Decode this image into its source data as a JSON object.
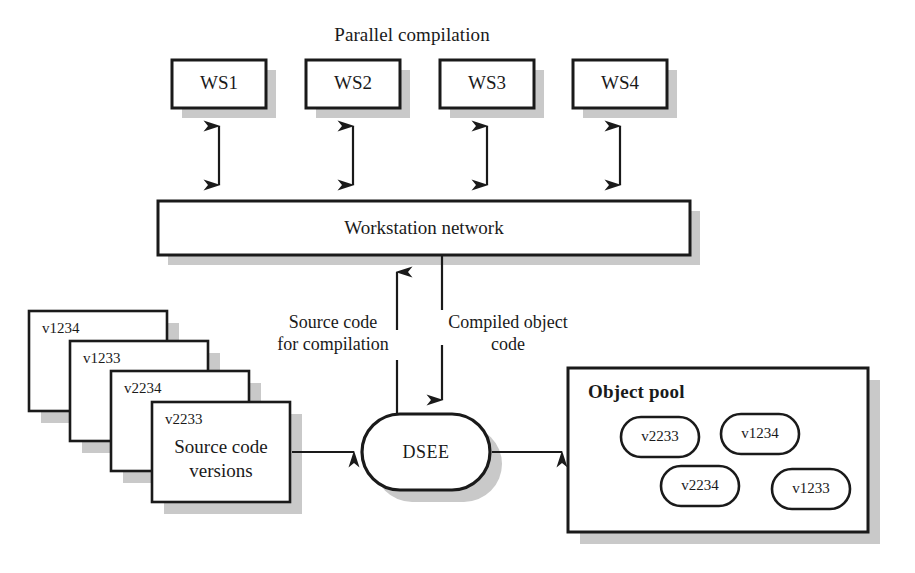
{
  "diagram": {
    "title": "Parallel compilation",
    "canvas": {
      "width": 915,
      "height": 573
    },
    "colors": {
      "stroke": "#1a1a1a",
      "shadow": "#c9c9c9",
      "fill": "#ffffff",
      "text": "#1a1a1a"
    }
  },
  "workstations": {
    "title": "Parallel compilation",
    "nodes": [
      {
        "id": "ws1",
        "label": "WS1",
        "x": 172,
        "y": 60,
        "w": 94,
        "h": 48
      },
      {
        "id": "ws2",
        "label": "WS2",
        "x": 306,
        "y": 60,
        "w": 94,
        "h": 48
      },
      {
        "id": "ws3",
        "label": "WS3",
        "x": 440,
        "y": 60,
        "w": 94,
        "h": 48
      },
      {
        "id": "ws4",
        "label": "WS4",
        "x": 573,
        "y": 60,
        "w": 94,
        "h": 48
      }
    ]
  },
  "network": {
    "label": "Workstation network",
    "x": 158,
    "y": 201,
    "w": 532,
    "h": 54
  },
  "flows": {
    "source_code": {
      "line1": "Source code",
      "line2": "for compilation",
      "direction": "up",
      "x": 397
    },
    "compiled_object": {
      "line1": "Compiled object",
      "line2": "code",
      "direction": "down",
      "x": 442
    }
  },
  "dsee": {
    "label": "DSEE",
    "x": 362,
    "y": 414,
    "w": 128,
    "h": 76
  },
  "source_versions": {
    "caption_line1": "Source code",
    "caption_line2": "versions",
    "cards": [
      {
        "version": "v1234",
        "x": 29,
        "y": 311,
        "w": 138,
        "h": 100,
        "z": 1
      },
      {
        "version": "v1233",
        "x": 70,
        "y": 341,
        "w": 138,
        "h": 100,
        "z": 2
      },
      {
        "version": "v2234",
        "x": 111,
        "y": 371,
        "w": 138,
        "h": 100,
        "z": 3
      },
      {
        "version": "v2233",
        "x": 152,
        "y": 402,
        "w": 138,
        "h": 100,
        "z": 4
      }
    ]
  },
  "object_pool": {
    "title": "Object pool",
    "x": 568,
    "y": 368,
    "w": 300,
    "h": 164,
    "objects": [
      {
        "version": "v2233",
        "cx": 660,
        "cy": 437,
        "rx": 39,
        "ry": 20
      },
      {
        "version": "v1234",
        "cx": 760,
        "cy": 434,
        "rx": 39,
        "ry": 20
      },
      {
        "version": "v2234",
        "cx": 700,
        "cy": 486,
        "rx": 39,
        "ry": 20
      },
      {
        "version": "v1233",
        "cx": 811,
        "cy": 489,
        "rx": 39,
        "ry": 20
      }
    ]
  },
  "connectors": [
    {
      "id": "ws1-network",
      "type": "double-arrow",
      "from": "ws1",
      "to": "network"
    },
    {
      "id": "ws2-network",
      "type": "double-arrow",
      "from": "ws2",
      "to": "network"
    },
    {
      "id": "ws3-network",
      "type": "double-arrow",
      "from": "ws3",
      "to": "network"
    },
    {
      "id": "ws4-network",
      "type": "double-arrow",
      "from": "ws4",
      "to": "network"
    },
    {
      "id": "dsee-to-network",
      "type": "arrow-up",
      "from": "dsee",
      "to": "network"
    },
    {
      "id": "network-to-dsee",
      "type": "arrow-down",
      "from": "network",
      "to": "dsee"
    },
    {
      "id": "versions-to-dsee",
      "type": "arrow-right",
      "from": "source_versions",
      "to": "dsee"
    },
    {
      "id": "dsee-to-pool",
      "type": "arrow-right",
      "from": "dsee",
      "to": "object_pool"
    }
  ]
}
